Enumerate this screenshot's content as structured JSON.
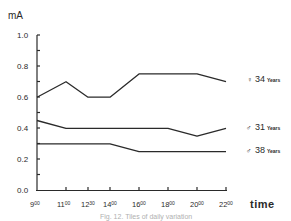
{
  "chart_data": {
    "type": "line",
    "title": "",
    "xlabel": "time",
    "ylabel": "mA",
    "ylim": [
      0.0,
      1.0
    ],
    "yticks": [
      "0.0",
      "0.2",
      "0.4",
      "0.6",
      "0.8",
      "1.0"
    ],
    "categories": [
      "9.00",
      "11.00",
      "12.30",
      "14.00",
      "16.00",
      "18.00",
      "20.00",
      "22.00"
    ],
    "x_hours": [
      9,
      11,
      12.5,
      14,
      16,
      18,
      20,
      22
    ],
    "grid": false,
    "legend_position": "right, inline at line ends",
    "series": [
      {
        "name": "♀ 34 Years",
        "symbol": "♀",
        "age": "34",
        "values": [
          0.6,
          0.7,
          0.6,
          0.6,
          0.75,
          0.75,
          0.75,
          0.7
        ]
      },
      {
        "name": "♂ 31 Years",
        "symbol": "♂",
        "age": "31",
        "values": [
          0.45,
          0.4,
          0.4,
          0.4,
          0.4,
          0.4,
          0.35,
          0.4
        ]
      },
      {
        "name": "♂ 38 Years",
        "symbol": "♂",
        "age": "38",
        "values": [
          0.3,
          0.3,
          0.3,
          0.3,
          0.25,
          0.25,
          0.25,
          0.25
        ]
      }
    ]
  },
  "axis": {
    "y_unit": "mA",
    "x_title": "time",
    "y_ticks": [
      {
        "label": "1.0"
      },
      {
        "label": "0.8"
      },
      {
        "label": "0.6"
      },
      {
        "label": "0.4"
      },
      {
        "label": "0.2"
      },
      {
        "label": "0.0"
      }
    ],
    "x_ticks": [
      {
        "hour": "9",
        "min": "00"
      },
      {
        "hour": "11",
        "min": "00"
      },
      {
        "hour": "12",
        "min": "30"
      },
      {
        "hour": "14",
        "min": "00"
      },
      {
        "hour": "16",
        "min": "00"
      },
      {
        "hour": "18",
        "min": "00"
      },
      {
        "hour": "20",
        "min": "00"
      },
      {
        "hour": "22",
        "min": "00"
      }
    ]
  },
  "legend": [
    {
      "symbol": "♀",
      "age": "34",
      "unit": "Years"
    },
    {
      "symbol": "♂",
      "age": "31",
      "unit": "Years"
    },
    {
      "symbol": "♂",
      "age": "38",
      "unit": "Years"
    }
  ],
  "caption": "Fig. 12. Tiles of daily variation"
}
